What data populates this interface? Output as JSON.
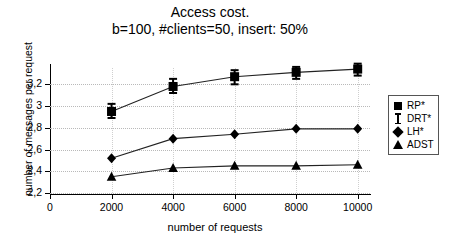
{
  "chart_data": {
    "type": "line",
    "title": "Access cost.",
    "subtitle": "b=100, #clients=50, insert: 50%",
    "xlabel": "number of requests",
    "ylabel": "number of messages per request",
    "x": [
      2000,
      4000,
      6000,
      8000,
      10000
    ],
    "xticks": [
      "0",
      "2000",
      "4000",
      "6000",
      "8000",
      "10000"
    ],
    "xtick_values": [
      0,
      2000,
      4000,
      6000,
      8000,
      10000
    ],
    "yticks": [
      "2,2",
      "2,4",
      "2,6",
      "2,8",
      "3",
      "3,2"
    ],
    "ytick_values": [
      2.2,
      2.4,
      2.6,
      2.8,
      3.0,
      3.2
    ],
    "xlim": [
      0,
      10400
    ],
    "ylim": [
      2.2,
      3.35
    ],
    "grid": true,
    "legend_position": "right",
    "series": [
      {
        "name": "RP*",
        "marker": "square",
        "values": [
          2.95,
          3.18,
          3.27,
          3.31,
          3.34
        ],
        "error_low": [
          2.89,
          3.12,
          3.2,
          3.25,
          3.28
        ],
        "error_high": [
          3.02,
          3.25,
          3.33,
          3.36,
          3.39
        ]
      },
      {
        "name": "DRT*",
        "marker": "errorbar",
        "values": [
          2.95,
          3.18,
          3.27,
          3.31,
          3.34
        ]
      },
      {
        "name": "LH*",
        "marker": "diamond",
        "values": [
          2.52,
          2.7,
          2.74,
          2.79,
          2.79
        ]
      },
      {
        "name": "ADST",
        "marker": "triangle",
        "values": [
          2.35,
          2.43,
          2.45,
          2.45,
          2.46
        ]
      }
    ]
  },
  "legend": {
    "items": [
      {
        "label": "RP*",
        "symbol": "square"
      },
      {
        "label": "DRT*",
        "symbol": "errorbar"
      },
      {
        "label": "LH*",
        "symbol": "diamond"
      },
      {
        "label": "ADST",
        "symbol": "triangle"
      }
    ]
  }
}
